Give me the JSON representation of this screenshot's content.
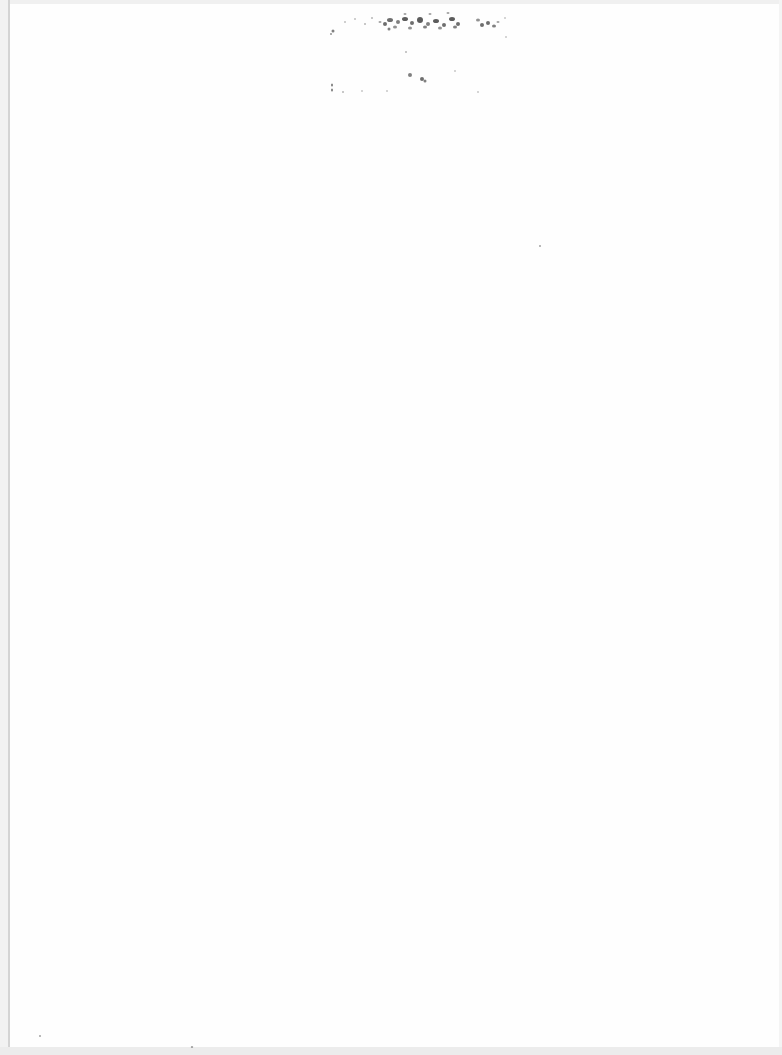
{
  "page": {
    "type": "blank scanned page",
    "background_color": "#fefefe",
    "border_line_color": "#d4d4d4",
    "noise_color": "#555555"
  }
}
